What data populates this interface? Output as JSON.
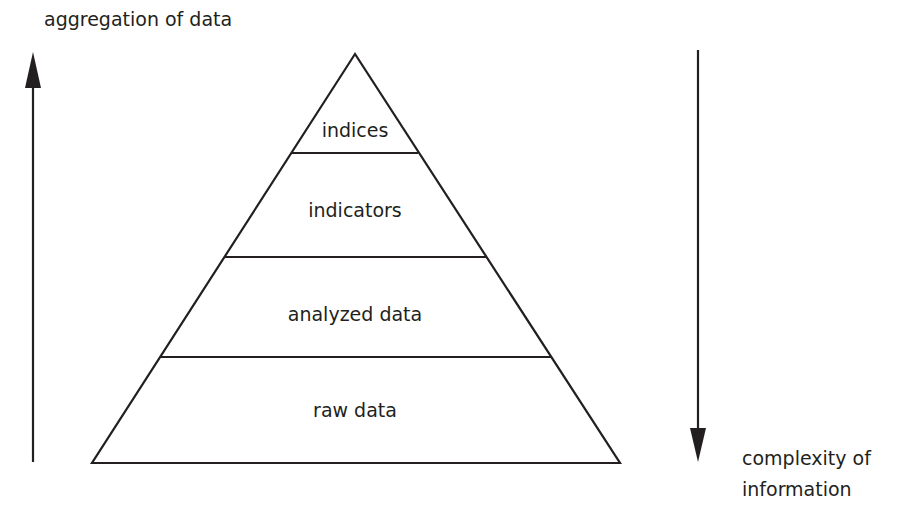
{
  "diagram": {
    "type": "pyramid",
    "left_axis": {
      "label": "aggregation of data",
      "direction": "up"
    },
    "right_axis": {
      "label_line1": "complexity of",
      "label_line2": "information",
      "direction": "down"
    },
    "levels": [
      {
        "label": "indices"
      },
      {
        "label": "indicators"
      },
      {
        "label": "analyzed data"
      },
      {
        "label": "raw data"
      }
    ],
    "colors": {
      "stroke": "#231f20",
      "background": "#ffffff"
    }
  }
}
